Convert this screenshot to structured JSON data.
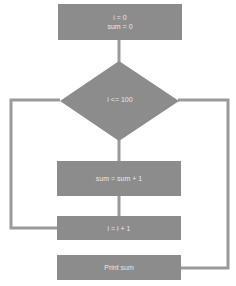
{
  "flowchart": {
    "colors": {
      "shape_fill": "#8c8c8c",
      "line": "#9a9a9a",
      "text": "#e8e8e8",
      "background": "#ffffff"
    },
    "nodes": [
      {
        "id": "init",
        "type": "process",
        "lines": [
          "i = 0",
          "sum = 0"
        ]
      },
      {
        "id": "cond",
        "type": "decision",
        "label": "i <= 100"
      },
      {
        "id": "accumulate",
        "type": "process",
        "label": "sum = sum + 1"
      },
      {
        "id": "increment",
        "type": "process",
        "label": "i = i + 1"
      },
      {
        "id": "output",
        "type": "process",
        "label": "Print sum"
      }
    ],
    "edges": [
      {
        "from": "init",
        "to": "cond"
      },
      {
        "from": "cond",
        "to": "accumulate",
        "branch": "bottom"
      },
      {
        "from": "accumulate",
        "to": "increment"
      },
      {
        "from": "increment",
        "to": "cond",
        "branch": "loop-left"
      },
      {
        "from": "cond",
        "to": "output",
        "branch": "right"
      }
    ]
  }
}
